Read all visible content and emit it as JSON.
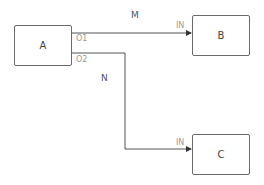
{
  "diagram": {
    "nodes": [
      {
        "id": "A",
        "label": "A",
        "ports_out": [
          "O1",
          "O2"
        ]
      },
      {
        "id": "B",
        "label": "B",
        "ports_in": [
          "IN"
        ]
      },
      {
        "id": "C",
        "label": "C",
        "ports_in": [
          "IN"
        ]
      }
    ],
    "edges": [
      {
        "label": "M",
        "from": "A.O1",
        "to": "B.IN"
      },
      {
        "label": "N",
        "from": "A.O2",
        "to": "C.IN"
      }
    ],
    "colors": {
      "line": "#555555",
      "border": "#6a6a6a",
      "port_label": "#9a9a9a"
    }
  }
}
